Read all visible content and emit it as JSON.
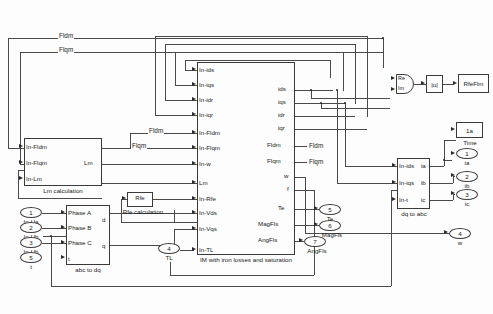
{
  "diagram": {
    "wire_labels": [
      {
        "text": "Fldm"
      },
      {
        "text": "Flqm"
      },
      {
        "text": "Fldm"
      },
      {
        "text": "Flqm"
      },
      {
        "text": "Fldm"
      },
      {
        "text": "Flqm"
      }
    ]
  },
  "blocks": {
    "lm_calc": {
      "name": "Lm calculation",
      "inputs": [
        "In-Fldm",
        "In-Flqm",
        "In-Lm"
      ],
      "outputs": [
        "Lm"
      ]
    },
    "rfe_calc": {
      "name": "Rfe calculation",
      "inner_label": "Rfe",
      "inputs": [],
      "outputs": []
    },
    "abc_to_dq": {
      "name": "abc to dq",
      "inputs": [
        "Phase A",
        "Phase B",
        "Phase C",
        "t"
      ],
      "outputs": [
        "d",
        "q"
      ]
    },
    "im_main": {
      "name": "IM with iron losses and saturation",
      "inputs": [
        "In-ids",
        "In-iqs",
        "In-idr",
        "In-iqr",
        "In-Fldm",
        "In-Flqm",
        "In-w",
        "Lm",
        "In-Rfe",
        "In-Vds",
        "In-Vqs",
        "In-TL"
      ],
      "outputs": [
        "ids",
        "iqs",
        "idr",
        "iqr",
        "Fldm",
        "Flqm",
        "w",
        "f",
        "Te",
        "MagFls",
        "AngFls"
      ]
    },
    "dq_to_abc": {
      "name": "dq to abc",
      "inputs": [
        "In-ids",
        "In-iqs",
        "In-t"
      ],
      "outputs": [
        "ia",
        "ib",
        "ic"
      ]
    },
    "reim": {
      "name": "Real-Imag to Complex",
      "port_re": "Re",
      "port_im": "Im"
    },
    "abs_block": {
      "name": "Complex to Magnitude",
      "label": "|u|"
    },
    "rfeflm_display": {
      "label": "RfeFlm"
    },
    "time_block": {
      "label": "1a",
      "name": "Time"
    }
  },
  "inputs": [
    {
      "num": "1",
      "label": "In-Ua"
    },
    {
      "num": "2",
      "label": "In-Ub"
    },
    {
      "num": "3",
      "label": "In-Ub"
    },
    {
      "num": "5",
      "label": "t"
    },
    {
      "num": "4",
      "label": "TL"
    }
  ],
  "outputs": [
    {
      "num": "1",
      "label": "ia"
    },
    {
      "num": "2",
      "label": "ib"
    },
    {
      "num": "3",
      "label": "ic"
    },
    {
      "num": "4",
      "label": "w"
    },
    {
      "num": "5",
      "label": "Te"
    },
    {
      "num": "6",
      "label": "MagFls"
    },
    {
      "num": "7",
      "label": "AngFls"
    }
  ],
  "colors": {
    "line": "#4a4a4a",
    "text": "#1a1a1a",
    "bg": "#fdfdfd"
  }
}
